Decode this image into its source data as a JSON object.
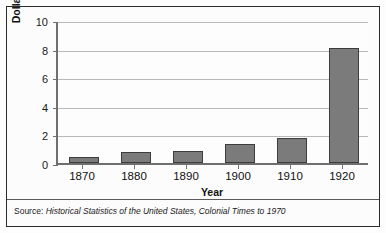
{
  "chart_data": {
    "type": "bar",
    "title": "",
    "xlabel": "Year",
    "ylabel": "Dollars (in billions)",
    "categories": [
      "1870",
      "1880",
      "1890",
      "1900",
      "1910",
      "1920"
    ],
    "values": [
      0.4,
      0.8,
      0.85,
      1.3,
      1.75,
      8.05
    ],
    "ylim": [
      0,
      10
    ],
    "yticks": [
      0,
      2,
      4,
      6,
      8,
      10
    ],
    "ytick_labels": [
      "0",
      "2",
      "4",
      "6",
      "8",
      "10"
    ],
    "grid": true,
    "legend": null,
    "bar_color": "#7b7b7b",
    "bar_border_color": "#3d3d3d",
    "gridline_color": "#b9b9b9",
    "axis_color": "#6f6f6f"
  },
  "footer": {
    "source_label": "Source:",
    "source_title": "Historical Statistics of the United States, Colonial Times to 1970"
  }
}
